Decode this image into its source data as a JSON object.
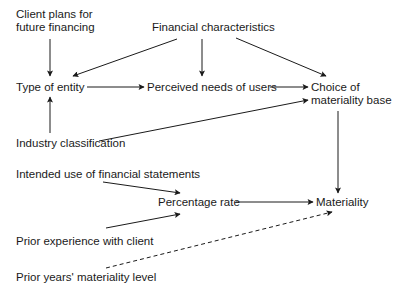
{
  "diagram": {
    "nodes": {
      "client_plans": {
        "line1": "Client plans for",
        "line2": "future financing"
      },
      "financial_characteristics": {
        "label": "Financial characteristics"
      },
      "type_of_entity": {
        "label": "Type of entity"
      },
      "perceived_needs": {
        "label": "Perceived needs of users"
      },
      "choice_materiality_base": {
        "line1": "Choice of",
        "line2": "materiality base"
      },
      "industry_classification": {
        "label": "Industry classification"
      },
      "intended_use": {
        "label": "Intended use of financial statements"
      },
      "percentage_rate": {
        "label": "Percentage rate"
      },
      "materiality": {
        "label": "Materiality"
      },
      "prior_experience": {
        "label": "Prior experience with client"
      },
      "prior_years_materiality": {
        "label": "Prior years' materiality level"
      }
    },
    "edges": [
      {
        "from": "Client plans for future financing",
        "to": "Type of entity",
        "style": "solid"
      },
      {
        "from": "Financial characteristics",
        "to": "Type of entity",
        "style": "solid"
      },
      {
        "from": "Financial characteristics",
        "to": "Perceived needs of users",
        "style": "solid"
      },
      {
        "from": "Financial characteristics",
        "to": "Choice of materiality base",
        "style": "solid"
      },
      {
        "from": "Type of entity",
        "to": "Perceived needs of users",
        "style": "solid"
      },
      {
        "from": "Perceived needs of users",
        "to": "Choice of materiality base",
        "style": "solid"
      },
      {
        "from": "Industry classification",
        "to": "Type of entity",
        "style": "solid"
      },
      {
        "from": "Industry classification",
        "to": "Choice of materiality base",
        "style": "solid"
      },
      {
        "from": "Choice of materiality base",
        "to": "Materiality",
        "style": "solid"
      },
      {
        "from": "Intended use of financial statements",
        "to": "Percentage rate",
        "style": "solid"
      },
      {
        "from": "Prior experience with client",
        "to": "Percentage rate",
        "style": "solid"
      },
      {
        "from": "Percentage rate",
        "to": "Materiality",
        "style": "solid"
      },
      {
        "from": "Prior years' materiality level",
        "to": "Materiality",
        "style": "dashed"
      }
    ],
    "colors": {
      "line": "#1a1a1a",
      "background": "#ffffff"
    }
  }
}
